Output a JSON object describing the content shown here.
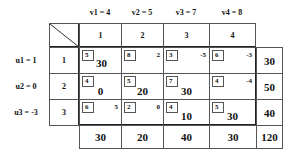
{
  "v_labels": [
    "v1 = 4",
    "v2 = 5",
    "v3 = 7",
    "v4 = 8"
  ],
  "u_labels": [
    "u1 = 1",
    "u2 = 0",
    "u3 = -3"
  ],
  "column_headers": [
    "1",
    "2",
    "3",
    "4"
  ],
  "row_headers": [
    "1",
    "2",
    "3"
  ],
  "rows": [
    {
      "cells": [
        {
          "cost": "5",
          "value": "30",
          "basic": true
        },
        {
          "cost": "8",
          "value": "2",
          "basic": false
        },
        {
          "cost": "3",
          "value": "-5",
          "basic": false
        },
        {
          "cost": "6",
          "value": "-3",
          "basic": false
        }
      ],
      "supply": "30"
    },
    {
      "cells": [
        {
          "cost": "4",
          "value": "0",
          "basic": true
        },
        {
          "cost": "5",
          "value": "20",
          "basic": true
        },
        {
          "cost": "7",
          "value": "30",
          "basic": true
        },
        {
          "cost": "4",
          "value": "-4",
          "basic": false
        }
      ],
      "supply": "50"
    },
    {
      "cells": [
        {
          "cost": "6",
          "value": "5",
          "basic": false
        },
        {
          "cost": "2",
          "value": "0",
          "basic": false
        },
        {
          "cost": "4",
          "value": "10",
          "basic": true
        },
        {
          "cost": "5",
          "value": "30",
          "basic": true
        }
      ],
      "supply": "40"
    }
  ],
  "demand": [
    "30",
    "20",
    "40",
    "30"
  ],
  "total": "120"
}
